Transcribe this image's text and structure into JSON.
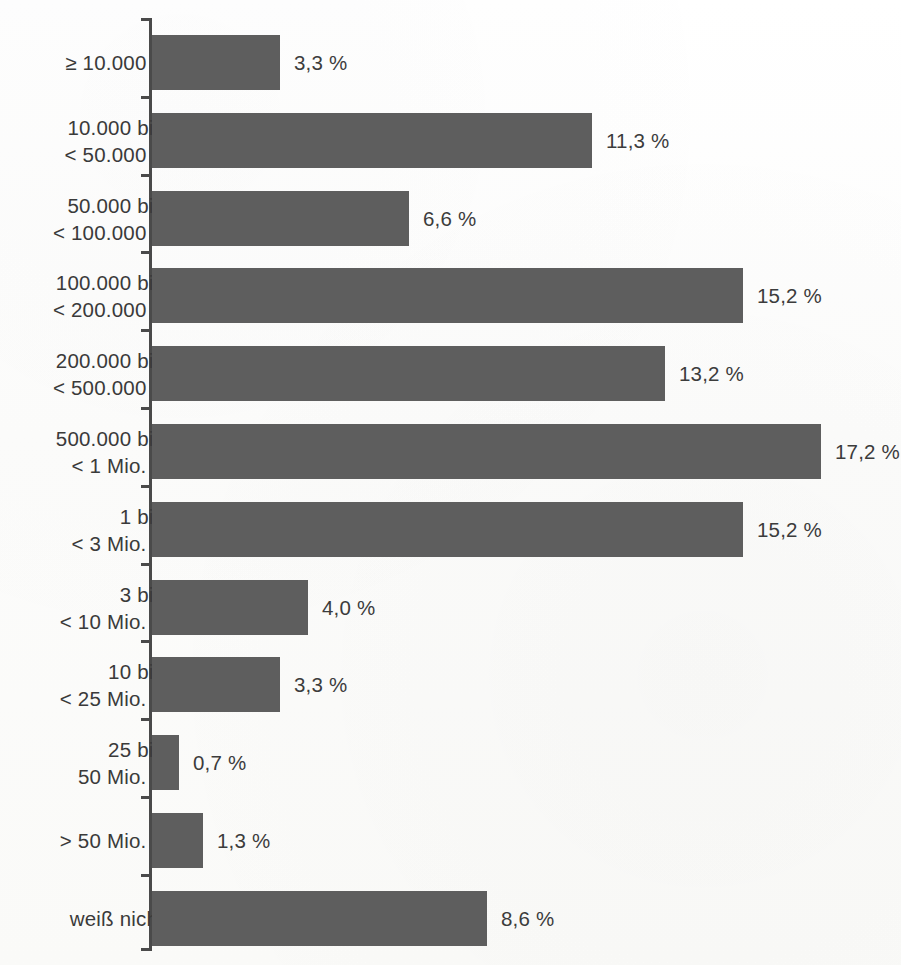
{
  "chart_data": {
    "type": "bar",
    "orientation": "horizontal",
    "title": "",
    "subtitle": "",
    "xlabel": "",
    "ylabel": "",
    "xlim": [
      0,
      19.3
    ],
    "grid": false,
    "legend": null,
    "value_suffix": "%",
    "decimal_separator": ",",
    "bar_color": "#5e5e5e",
    "text_color": "#3a3a3a",
    "axis_color": "#4a4a4a",
    "background_color": "#fdfdfc",
    "categories": [
      "≥ 10.000 €",
      "10.000 bis\n< 50.000 €",
      "50.000 bis\n< 100.000 €",
      "100.000 bis\n< 200.000 €",
      "200.000 bis\n< 500.000 €",
      "500.000 bis\n< 1 Mio. €",
      "1 bis\n< 3 Mio. €",
      "3 bis\n< 10 Mio. €",
      "10 bis\n< 25 Mio. €",
      "25 bis\n50 Mio. €",
      "> 50 Mio. €",
      "weiß nicht"
    ],
    "values": [
      3.3,
      11.3,
      6.6,
      15.2,
      13.2,
      17.2,
      15.2,
      4.0,
      3.3,
      0.7,
      1.3,
      8.6
    ],
    "value_labels": [
      "3,3 %",
      "11,3 %",
      "6,6 %",
      "15,2 %",
      "13,2 %",
      "17,2 %",
      "15,2 %",
      "4,0 %",
      "3,3 %",
      "0,7 %",
      "1,3 %",
      "8,6 %"
    ]
  }
}
